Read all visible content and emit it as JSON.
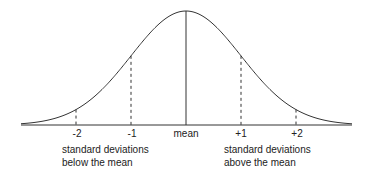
{
  "chart_data": {
    "type": "line",
    "title": "",
    "x": [
      -3,
      -2,
      -1,
      0,
      1,
      2,
      3
    ],
    "tick_labels": [
      "-2",
      "-1",
      "mean",
      "+1",
      "+2"
    ],
    "tick_positions": [
      -2,
      -1,
      0,
      1,
      2
    ],
    "series": [
      {
        "name": "normal density",
        "function": "exp(-x^2/2)"
      }
    ],
    "markers": {
      "solid": [
        0
      ],
      "dashed": [
        -2,
        -1,
        1,
        2
      ]
    },
    "annotations": [
      "standard deviations below the mean",
      "standard deviations above the mean"
    ],
    "xlabel": "",
    "ylabel": "",
    "grid": false
  },
  "axis": {
    "ticks": [
      "-2",
      "-1",
      "mean",
      "+1",
      "+2"
    ]
  },
  "captions": {
    "below_line1": "standard deviations",
    "below_line2": "below the mean",
    "above_line1": "standard deviations",
    "above_line2": "above the mean"
  },
  "colors": {
    "line": "#333333",
    "text": "#222222"
  }
}
